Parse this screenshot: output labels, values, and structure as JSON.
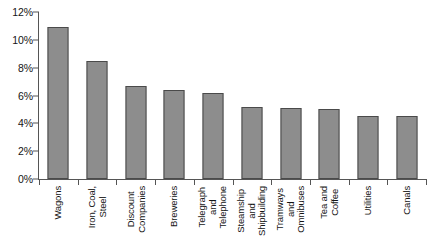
{
  "chart_data": {
    "type": "bar",
    "title": "",
    "subtitle": "",
    "xlabel": "",
    "ylabel": "",
    "ylim": [
      0,
      12
    ],
    "grid": false,
    "legend": null,
    "value_suffix": "%",
    "y_ticks": [
      "0%",
      "2%",
      "4%",
      "6%",
      "8%",
      "10%",
      "12%"
    ],
    "y_tick_values": [
      0,
      2,
      4,
      6,
      8,
      10,
      12
    ],
    "categories": [
      "Wagons",
      "Iron, Coal, Steel",
      "Discount Companies",
      "Breweries",
      "Telegraph and Telephone",
      "Steamship and Shipbuilding",
      "Tramways and Omnibuses",
      "Tea and Coffee",
      "Utilities",
      "Canals"
    ],
    "category_lines": [
      [
        "Wagons"
      ],
      [
        "Iron, Coal,",
        "Steel"
      ],
      [
        "Discount",
        "Companies"
      ],
      [
        "Breweries"
      ],
      [
        "Telegraph",
        "and",
        "Telephone"
      ],
      [
        "Steamship",
        "and",
        "Shipbuilding"
      ],
      [
        "Tramways",
        "and",
        "Omnibuses"
      ],
      [
        "Tea and",
        "Coffee"
      ],
      [
        "Utilities"
      ],
      [
        "Canals"
      ]
    ],
    "values": [
      10.9,
      8.5,
      6.7,
      6.4,
      6.2,
      5.2,
      5.1,
      5.0,
      4.5,
      4.5
    ],
    "colors": {
      "bar_fill": "#8d8d8d",
      "bar_border": "#4a4a4a",
      "axis": "#555555",
      "text": "#141414",
      "background": "#ffffff"
    }
  }
}
